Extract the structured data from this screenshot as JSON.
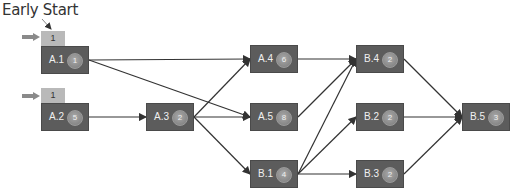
{
  "title": "Early Start",
  "colors": {
    "node_fill": "#5c5c5c",
    "duration_circle": "#8e8e8e",
    "early_start_tab": "#b9b9b9",
    "edge": "#333333",
    "start_arrow": "#8a8a8a"
  },
  "nodes": [
    {
      "id": "A.1",
      "label": "A.1",
      "duration": "1",
      "early_start": "1",
      "x": 41,
      "y": 46
    },
    {
      "id": "A.2",
      "label": "A.2",
      "duration": "5",
      "early_start": "1",
      "x": 41,
      "y": 103
    },
    {
      "id": "A.3",
      "label": "A.3",
      "duration": "2",
      "x": 146,
      "y": 103
    },
    {
      "id": "A.4",
      "label": "A.4",
      "duration": "6",
      "x": 250,
      "y": 45
    },
    {
      "id": "A.5",
      "label": "A.5",
      "duration": "8",
      "x": 250,
      "y": 103
    },
    {
      "id": "B.1",
      "label": "B.1",
      "duration": "4",
      "x": 250,
      "y": 160
    },
    {
      "id": "B.4",
      "label": "B.4",
      "duration": "2",
      "x": 356,
      "y": 45
    },
    {
      "id": "B.2",
      "label": "B.2",
      "duration": "2",
      "x": 356,
      "y": 103
    },
    {
      "id": "B.3",
      "label": "B.3",
      "duration": "2",
      "x": 356,
      "y": 160
    },
    {
      "id": "B.5",
      "label": "B.5",
      "duration": "3",
      "x": 462,
      "y": 103
    }
  ],
  "edges": [
    [
      "A.1",
      "A.4"
    ],
    [
      "A.1",
      "A.5"
    ],
    [
      "A.2",
      "A.3"
    ],
    [
      "A.3",
      "A.4"
    ],
    [
      "A.3",
      "A.5"
    ],
    [
      "A.3",
      "B.1"
    ],
    [
      "A.4",
      "B.4"
    ],
    [
      "A.5",
      "B.4"
    ],
    [
      "B.1",
      "B.4"
    ],
    [
      "B.1",
      "B.2"
    ],
    [
      "B.1",
      "B.3"
    ],
    [
      "B.4",
      "B.5"
    ],
    [
      "B.2",
      "B.5"
    ],
    [
      "B.3",
      "B.5"
    ]
  ]
}
